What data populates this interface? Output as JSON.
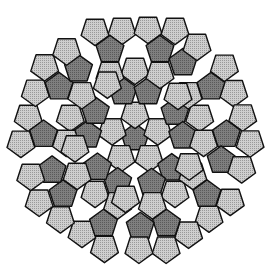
{
  "canvas": {
    "width": 271,
    "height": 274,
    "background": "#ffffff"
  },
  "center": [
    135,
    138
  ],
  "symmetry_order": 5,
  "pentagon_radius": 14.6,
  "stroke": {
    "color": "#111111",
    "width": 1.4
  },
  "colors": {
    "light": "#cfcfcf",
    "dark": "#7f7f7f",
    "light_dot": "#9a9a9a",
    "dark_dot": "#5a5a5a",
    "gap": "#ffffff"
  },
  "seed_tiles": [
    {
      "x": 0,
      "y": 0,
      "orient": "up",
      "shade": "dark"
    },
    {
      "x": 0,
      "y": -24,
      "orient": "down",
      "shade": "light"
    },
    {
      "x": -12,
      "y": -46,
      "orient": "up",
      "shade": "dark"
    },
    {
      "x": 13,
      "y": -46,
      "orient": "up",
      "shade": "dark"
    },
    {
      "x": -13,
      "y": -108,
      "orient": "down",
      "shade": "light"
    },
    {
      "x": 13,
      "y": -109,
      "orient": "down",
      "shade": "light"
    },
    {
      "x": -40,
      "y": -107,
      "orient": "down",
      "shade": "light"
    },
    {
      "x": 40,
      "y": -108,
      "orient": "down",
      "shade": "light"
    },
    {
      "x": -25,
      "y": -88,
      "orient": "up",
      "shade": "dark"
    },
    {
      "x": 25,
      "y": -88,
      "orient": "up",
      "shade": "dark"
    },
    {
      "x": 0,
      "y": -68,
      "orient": "down",
      "shade": "light"
    },
    {
      "x": 25,
      "y": -64,
      "orient": "down",
      "shade": "light"
    },
    {
      "x": -25,
      "y": -64,
      "orient": "down",
      "shade": "light"
    },
    {
      "x": 48,
      "y": -75,
      "orient": "up",
      "shade": "dark"
    },
    {
      "x": 62,
      "y": -92,
      "orient": "down",
      "shade": "light"
    },
    {
      "x": 43,
      "y": -43,
      "orient": "down",
      "shade": "light"
    },
    {
      "x": 35,
      "y": -26,
      "orient": "up",
      "shade": "dark"
    }
  ],
  "labels": {
    "tile_light": "light pentagon",
    "tile_dark": "dark pentagon"
  }
}
